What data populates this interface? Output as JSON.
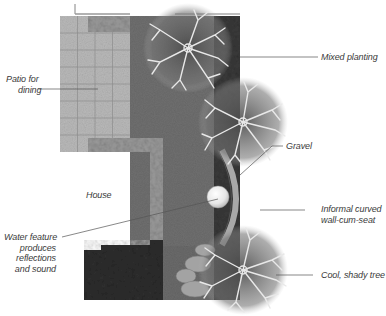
{
  "diagram": {
    "type": "garden-plan",
    "colors": {
      "lawn": "#6f6f6f",
      "patio": "#b9b9b9",
      "patio_grid": "#8d8d8d",
      "planting_dark": "#2e2e2e",
      "border_planting": "#9a9a9a",
      "tree_branch": "#e8e8e8",
      "gravel_wall": "#a8a8a8",
      "water_feature": "#f2f2f2",
      "stepping_stones": "#a0a0a0",
      "label_text": "#3a3a3a",
      "leader_line": "#555555"
    },
    "patio": {
      "columns": 4,
      "rows": 8
    },
    "trees": [
      {
        "name": "top-tree",
        "cx": 188,
        "cy": 48,
        "r": 45
      },
      {
        "name": "middle-tree",
        "cx": 243,
        "cy": 122,
        "r": 45
      },
      {
        "name": "cool-shady-tree",
        "cx": 243,
        "cy": 270,
        "r": 45
      }
    ]
  },
  "labels": {
    "patio": [
      "Patio for",
      "dining"
    ],
    "mixed_planting": "Mixed planting",
    "gravel": "Gravel",
    "house": "House",
    "water_feature": [
      "Water feature",
      "produces",
      "reflections",
      "and sound"
    ],
    "curved_wall": [
      "Informal curved",
      "wall-cum-seat"
    ],
    "shady_tree": "Cool, shady tree"
  }
}
